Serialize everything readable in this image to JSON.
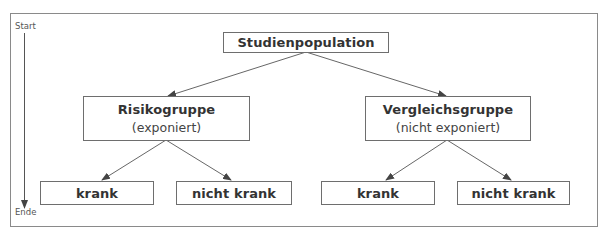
{
  "diagram": {
    "type": "cohort-study-flow",
    "timeline": {
      "start_label": "Start",
      "end_label": "Ende"
    },
    "root": {
      "label": "Studienpopulation"
    },
    "groups": [
      {
        "title": "Risikogruppe",
        "subtitle": "(exponiert)",
        "outcomes": [
          "krank",
          "nicht krank"
        ]
      },
      {
        "title": "Vergleichsgruppe",
        "subtitle": "(nicht exponiert)",
        "outcomes": [
          "krank",
          "nicht krank"
        ]
      }
    ],
    "colors": {
      "frame": "#8a8a8a",
      "box_border": "#6e6e6e",
      "arrow": "#555555",
      "text": "#333333"
    }
  }
}
